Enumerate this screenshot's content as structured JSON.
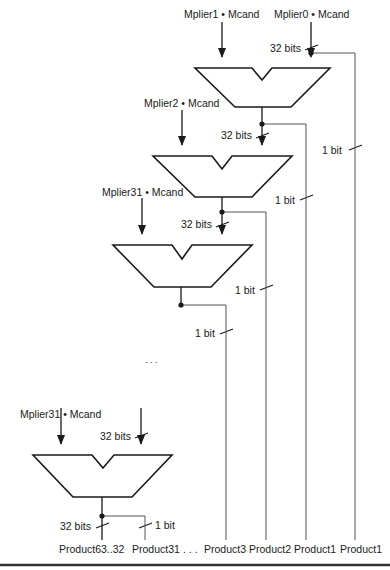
{
  "figure": {
    "type": "multiplier-adder-array",
    "stages": [
      {
        "id": "adder-1",
        "input_left": "Mplier1 • Mcand",
        "input_right": "Mplier0 • Mcand",
        "input_right_width": "32 bits",
        "tap_width": "1 bit"
      },
      {
        "id": "adder-2",
        "input_left": "Mplier2 • Mcand",
        "input_right_width": "32 bits",
        "tap_width": "1 bit"
      },
      {
        "id": "adder-3",
        "input_left": "Mplier31 • Mcand",
        "input_right_width": "32 bits",
        "tap_width": "1 bit"
      },
      {
        "id": "adder-last",
        "input_left": "Mplier31 • Mcand",
        "input_right_width": "32 bits",
        "output_width": "32 bits",
        "tap_width": "1 bit"
      }
    ],
    "right_bus_width": "1 bit",
    "ellipsis": ". . .",
    "outputs": [
      "Product63..32",
      "Product31",
      ". . .",
      "Product3",
      "Product2",
      "Product1",
      "Product1"
    ]
  },
  "colors": {
    "stroke": "#1a1a1a",
    "wire": "#555555",
    "background": "#ffffff"
  }
}
